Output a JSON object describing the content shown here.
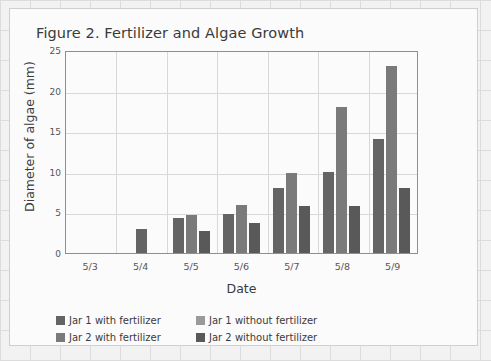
{
  "chart_data": {
    "type": "bar",
    "title": "Figure 2. Fertilizer and Algae Growth",
    "xlabel": "Date",
    "ylabel": "Diameter of algae (mm)",
    "categories": [
      "5/3",
      "5/4",
      "5/5",
      "5/6",
      "5/7",
      "5/8",
      "5/9"
    ],
    "ylim": [
      0,
      25
    ],
    "yticks": [
      0,
      5,
      10,
      15,
      20,
      25
    ],
    "grid": true,
    "legend_position": "bottom-left",
    "series": [
      {
        "name": "Jar 1 with fertilizer",
        "color": "#646464",
        "values": [
          0,
          3.0,
          4.3,
          4.8,
          8.0,
          10.0,
          14.0
        ]
      },
      {
        "name": "Jar 1 without fertilizer",
        "color": "#9a9a9a",
        "values": [
          0,
          0,
          0,
          0,
          0,
          0,
          0
        ]
      },
      {
        "name": "Jar 2 with fertilizer",
        "color": "#7a7a7a",
        "values": [
          0,
          0,
          4.7,
          5.9,
          9.9,
          18.0,
          23.0
        ]
      },
      {
        "name": "Jar 2 without fertilizer",
        "color": "#595959",
        "values": [
          0,
          0,
          2.7,
          3.7,
          5.8,
          5.8,
          8.0
        ]
      }
    ]
  },
  "legend": {
    "items": [
      {
        "label": "Jar 1 with fertilizer",
        "color": "#646464"
      },
      {
        "label": "Jar 1 without fertilizer",
        "color": "#9a9a9a"
      },
      {
        "label": "Jar 2 with fertilizer",
        "color": "#7a7a7a"
      },
      {
        "label": "Jar 2 without fertilizer",
        "color": "#595959"
      }
    ]
  }
}
